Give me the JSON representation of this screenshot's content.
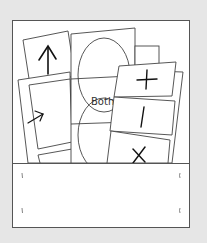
{
  "illustration": {
    "title": "Folder pocket with sorting cards",
    "background_color": "#e6e6e6",
    "paper_color": "#ffffff",
    "line_color": "#444444",
    "cards": [
      {
        "label": "",
        "icon": "arrow-up-icon"
      },
      {
        "label": "",
        "icon": "arrow-right-icon"
      },
      {
        "label": "Both",
        "icon": "venn-diagram-icon"
      },
      {
        "label": "",
        "icon": "plus-icon"
      },
      {
        "label": "",
        "icon": "minus-icon"
      },
      {
        "label": "",
        "icon": "times-icon"
      }
    ],
    "venn_label": "Both"
  }
}
